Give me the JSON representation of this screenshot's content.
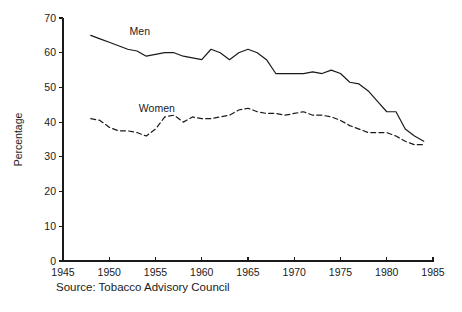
{
  "chart_data": {
    "type": "line",
    "title": "",
    "subtitle": "",
    "xlabel": "",
    "ylabel": "Percentage",
    "xlim": [
      1945,
      1985
    ],
    "ylim": [
      0,
      70
    ],
    "grid": false,
    "legend_position": "inline-annotations",
    "xticks": [
      1945,
      1950,
      1955,
      1960,
      1965,
      1970,
      1975,
      1980,
      1985
    ],
    "yticks": [
      0,
      10,
      20,
      30,
      40,
      50,
      60,
      70
    ],
    "xtick_labels": [
      "1945",
      "1950",
      "1955",
      "1960",
      "1965",
      "1970",
      "1975",
      "1980",
      "1985"
    ],
    "ytick_labels": [
      "0",
      "10",
      "20",
      "30",
      "40",
      "50",
      "60",
      "70"
    ],
    "annotations": [
      {
        "text": "Men",
        "x": 1952.2,
        "y": 66.0
      },
      {
        "text": "Women",
        "x": 1953.2,
        "y": 44.0
      }
    ],
    "caption": "Source: Tobacco Advisory Council",
    "series": [
      {
        "name": "Men",
        "style": "solid",
        "color": "#1a1a1a",
        "x": [
          1948,
          1949,
          1950,
          1951,
          1952,
          1953,
          1954,
          1955,
          1956,
          1957,
          1958,
          1959,
          1960,
          1961,
          1962,
          1963,
          1964,
          1965,
          1966,
          1967,
          1968,
          1969,
          1970,
          1971,
          1972,
          1973,
          1974,
          1975,
          1976,
          1977,
          1978,
          1979,
          1980,
          1981,
          1982,
          1983,
          1984
        ],
        "values": [
          65.0,
          64.0,
          63.0,
          62.0,
          61.0,
          60.5,
          59.0,
          59.5,
          60.0,
          60.0,
          59.0,
          58.5,
          58.0,
          61.0,
          60.0,
          58.0,
          60.0,
          61.0,
          60.0,
          58.0,
          54.0,
          54.0,
          54.0,
          54.0,
          54.5,
          54.0,
          55.0,
          54.0,
          51.5,
          51.0,
          49.0,
          46.0,
          43.0,
          43.0,
          38.0,
          36.0,
          34.5
        ]
      },
      {
        "name": "Women",
        "style": "dashed",
        "color": "#1a1a1a",
        "x": [
          1948,
          1949,
          1950,
          1951,
          1952,
          1953,
          1954,
          1955,
          1956,
          1957,
          1958,
          1959,
          1960,
          1961,
          1962,
          1963,
          1964,
          1965,
          1966,
          1967,
          1968,
          1969,
          1970,
          1971,
          1972,
          1973,
          1974,
          1975,
          1976,
          1977,
          1978,
          1979,
          1980,
          1981,
          1982,
          1983,
          1984
        ],
        "values": [
          41.0,
          40.5,
          38.5,
          37.5,
          37.5,
          37.0,
          36.0,
          38.0,
          41.5,
          42.0,
          40.0,
          41.5,
          41.0,
          41.0,
          41.5,
          42.0,
          43.5,
          44.0,
          43.0,
          42.5,
          42.5,
          42.0,
          42.5,
          43.0,
          42.0,
          42.0,
          41.5,
          40.5,
          39.0,
          38.0,
          37.0,
          37.0,
          37.0,
          36.0,
          34.5,
          33.5,
          33.5
        ]
      }
    ]
  },
  "figure": {
    "caption": "Source: Tobacco Advisory Council",
    "ylabel": "Percentage",
    "men_label": "Men",
    "women_label": "Women"
  }
}
